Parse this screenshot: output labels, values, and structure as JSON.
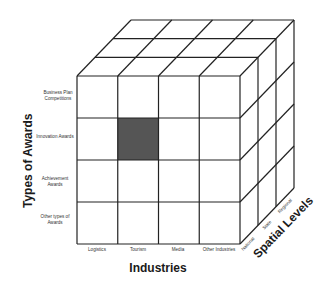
{
  "diagram": {
    "type": "3d-cube-matrix",
    "highlight_color": "#555555",
    "line_color": "#222222",
    "axes": {
      "y": {
        "title": "Types of Awards",
        "categories": [
          {
            "line1": "Business Plan",
            "line2": "Competitions"
          },
          {
            "line1": "Innovation Awards",
            "line2": ""
          },
          {
            "line1": "Achievement",
            "line2": "Awards"
          },
          {
            "line1": "Other types of",
            "line2": "Awards"
          }
        ]
      },
      "x": {
        "title": "Industries",
        "categories": [
          "Logistics",
          "Tourism",
          "Media",
          "Other Industries"
        ]
      },
      "z": {
        "title": "Spatial Levels",
        "categories": [
          "National",
          "State",
          "Regional"
        ]
      }
    },
    "highlighted_cell": {
      "industry": "Tourism",
      "award_type": "Innovation Awards",
      "spatial_level": "National"
    }
  }
}
